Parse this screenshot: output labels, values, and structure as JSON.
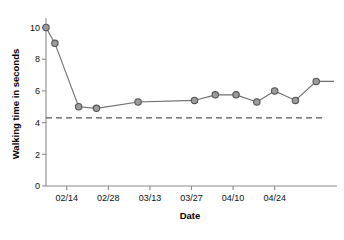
{
  "chart_data": {
    "type": "line",
    "title": "",
    "xlabel": "Date",
    "ylabel": "Walking time in seconds",
    "xlim": [
      0,
      98
    ],
    "ylim": [
      0,
      10.6
    ],
    "grid": false,
    "legend": "none",
    "y_ticks": [
      0,
      2,
      4,
      6,
      8,
      10
    ],
    "y_tick_labels": [
      "0",
      "2",
      "4",
      "6",
      "8",
      "10"
    ],
    "x_ticks": [
      7,
      21,
      35,
      49,
      63,
      77
    ],
    "x_tick_labels": [
      "02/14",
      "02/28",
      "03/13",
      "03/27",
      "04/10",
      "04/24"
    ],
    "reference_line": {
      "label": "",
      "value": 4.3,
      "style": "dashed"
    },
    "series": [
      {
        "name": "Walking time",
        "marker": "circle",
        "x": [
          0,
          3,
          11,
          17,
          31,
          50,
          57,
          64,
          71,
          77,
          84,
          91,
          97
        ],
        "y": [
          10.0,
          9.0,
          5.0,
          4.9,
          5.3,
          5.4,
          5.75,
          5.75,
          5.3,
          6.0,
          5.4,
          6.6,
          6.6
        ],
        "points": [
          {
            "date": "02/07",
            "value": 10.0
          },
          {
            "date": "02/10",
            "value": 9.0
          },
          {
            "date": "02/18",
            "value": 5.0
          },
          {
            "date": "02/24",
            "value": 4.9
          },
          {
            "date": "03/09",
            "value": 5.3
          },
          {
            "date": "03/24",
            "value": 5.4
          },
          {
            "date": "03/30",
            "value": 5.75
          },
          {
            "date": "04/06",
            "value": 5.75
          },
          {
            "date": "04/17",
            "value": 5.3
          },
          {
            "date": "04/22",
            "value": 6.0
          },
          {
            "date": "04/28",
            "value": 5.4
          },
          {
            "date": "05/04",
            "value": 6.6
          }
        ],
        "vertex_without_marker": {
          "value": 5.1
        }
      }
    ]
  }
}
